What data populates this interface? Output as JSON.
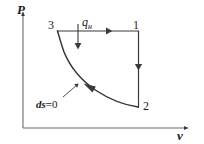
{
  "figure": {
    "type": "thermodynamic-cycle-diagram",
    "axes": {
      "y_label": "P",
      "x_label": "v",
      "origin_px": [
        23,
        128
      ],
      "y_axis_top_px": [
        23,
        10
      ],
      "x_axis_right_px": [
        190,
        128
      ]
    },
    "state_points": [
      {
        "id": "3",
        "label": "3",
        "px": [
          57,
          31
        ]
      },
      {
        "id": "1",
        "label": "1",
        "px": [
          138,
          31
        ]
      },
      {
        "id": "2",
        "label": "2",
        "px": [
          138,
          107
        ]
      }
    ],
    "processes": [
      {
        "name": "isobaric-heat-addition",
        "from": "3",
        "to": "1",
        "kind": "straight",
        "arrow_direction": "right",
        "arrow_px": [
          110,
          31
        ]
      },
      {
        "name": "isochoric-process",
        "from": "1",
        "to": "2",
        "kind": "straight",
        "arrow_direction": "down",
        "arrow_px": [
          138,
          69
        ]
      },
      {
        "name": "isentropic-compression",
        "from": "2",
        "to": "3",
        "kind": "curve",
        "arrow_direction": "up-left",
        "arrow_px": [
          88,
          86
        ]
      }
    ],
    "annotations": {
      "heat_input": {
        "symbol": "q",
        "subscript": "н",
        "arrow_direction": "down",
        "arrow_from_px": [
          78,
          25
        ],
        "arrow_to_px": [
          78,
          50
        ]
      },
      "entropy": {
        "text_prefix": "ds",
        "equals": "=",
        "value": "0",
        "leader_from_px": [
          62,
          98
        ],
        "leader_to_px": [
          76,
          86
        ]
      }
    },
    "colors": {
      "stroke": "#3a3a3a",
      "curve": "#333333",
      "text": "#1a1a1a",
      "background": "#ffffff"
    }
  }
}
